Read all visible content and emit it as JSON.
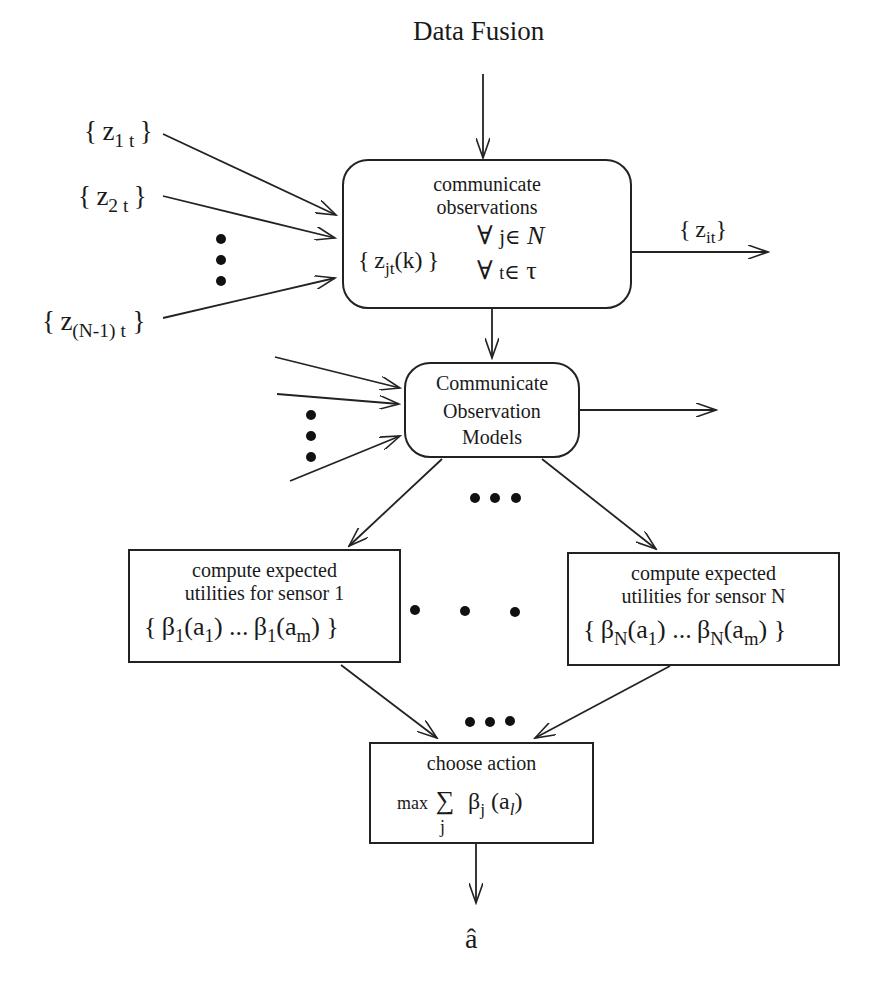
{
  "title": "Data Fusion",
  "inputs": {
    "z1": {
      "base": "z",
      "sub": "1 t",
      "open": "{",
      "close": "}"
    },
    "z2": {
      "base": "z",
      "sub": "2 t",
      "open": "{",
      "close": "}"
    },
    "zN1": {
      "base": "z",
      "sub": "(N-1)  t",
      "open": "{",
      "close": "}"
    }
  },
  "box_observations": {
    "line1": "communicate",
    "line2": "observations",
    "set_base": "z",
    "set_sub": "jt",
    "set_arg": "(k)",
    "open": "{",
    "close": "}",
    "quant1": "∀ j∈ N",
    "quant1_forall": "∀",
    "quant1_var": "j",
    "quant1_in": "∈",
    "quant1_set": "N",
    "quant2_forall": "∀",
    "quant2_var": "t",
    "quant2_in": "∈",
    "quant2_set": "τ"
  },
  "output_observations": {
    "base": "z",
    "sub": "it",
    "open": "{",
    "close": "}"
  },
  "box_models": {
    "line1": "Communicate",
    "line2": "Observation",
    "line3": "Models"
  },
  "box_sensor1": {
    "line1": "compute expected",
    "line2": "utilities  for sensor 1",
    "beta": "β",
    "beta_sub": "1",
    "a": "a",
    "a_sub_first": "1",
    "a_sub_last": "m",
    "ellipsis": "...",
    "open": "{",
    "close": "}"
  },
  "box_sensorN": {
    "line1": "compute expected",
    "line2": "utilities   for sensor N",
    "beta": "β",
    "beta_sub": "N",
    "a": "a",
    "a_sub_first": "1",
    "a_sub_last": "m",
    "ellipsis": "...",
    "open": "{",
    "close": "}"
  },
  "box_choose": {
    "line1": "choose action",
    "max": "max",
    "sum": "∑",
    "sum_index": "j",
    "beta": "β",
    "beta_sub": "j",
    "arg_open": "(a",
    "arg_sub": "l",
    "arg_close": ")"
  },
  "output": "â",
  "colors": {
    "stroke": "#222222",
    "background": "#ffffff",
    "text": "#1a1a1a"
  }
}
